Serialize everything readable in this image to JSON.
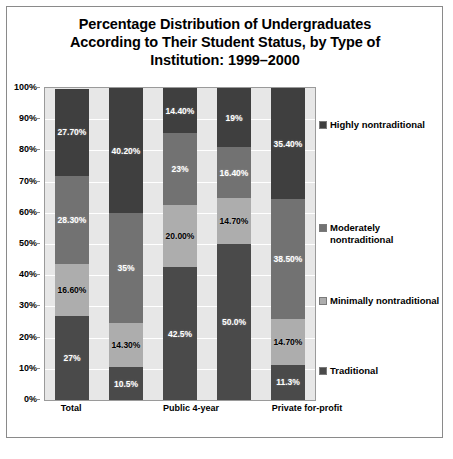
{
  "chart_data": {
    "type": "bar",
    "subtype": "stacked-100-percent",
    "title": "Percentage Distribution of Undergraduates According to Their Student Status, by Type of Institution: 1999–2000",
    "title_lines": [
      "Percentage Distribution of Undergraduates",
      "According to Their Student Status, by Type of",
      "Institution: 1999–2000"
    ],
    "xlabel": "",
    "ylabel": "",
    "ylim": [
      0,
      100
    ],
    "grid": true,
    "legend_position": "right",
    "categories": [
      "Total",
      "",
      "Public 4-year",
      "",
      "Private for-profit"
    ],
    "x_tick_labels_visible": [
      "Total",
      "Public 4-year",
      "Private for-profit"
    ],
    "y_tick_labels": [
      "100%",
      "90%",
      "80%",
      "70%",
      "60%",
      "50%",
      "40%",
      "30%",
      "20%",
      "10%",
      "0%"
    ],
    "y_tick_values": [
      100,
      90,
      80,
      70,
      60,
      50,
      40,
      30,
      20,
      10,
      0
    ],
    "series": [
      {
        "name": "Traditional",
        "color": "#4a4a4a",
        "values": [
          27.0,
          10.5,
          42.5,
          50.0,
          11.3
        ],
        "labels": [
          "27%",
          "10.5%",
          "42.5%",
          "50.0%",
          "11.3%"
        ]
      },
      {
        "name": "Minimally nontraditional",
        "color": "#adadad",
        "values": [
          16.6,
          14.3,
          20.0,
          14.7,
          14.7
        ],
        "labels": [
          "16.60%",
          "14.30%",
          "20.00%",
          "14.70%",
          "14.70%"
        ]
      },
      {
        "name": "Moderately nontraditional",
        "color": "#727272",
        "values": [
          28.3,
          35.0,
          23.0,
          16.4,
          38.5
        ],
        "labels": [
          "28.30%",
          "35%",
          "23%",
          "16.40%",
          "38.50%"
        ]
      },
      {
        "name": "Highly nontraditional",
        "color": "#3f3f3f",
        "values": [
          27.7,
          40.2,
          14.4,
          19.0,
          35.4
        ],
        "labels": [
          "27.70%",
          "40.20%",
          "14.40%",
          "19%",
          "35.40%"
        ]
      }
    ]
  },
  "legend": {
    "entries": [
      {
        "label": "Highly nontraditional",
        "color": "#3f3f3f"
      },
      {
        "label": "Moderately\nnontraditional",
        "color": "#727272"
      },
      {
        "label": "Minimally nontraditional",
        "color": "#adadad"
      },
      {
        "label": "Traditional",
        "color": "#4a4a4a"
      }
    ]
  },
  "colors": {
    "plot_background": "#e7e7e7",
    "gridline": "#ffffff",
    "frame_border": "#8a8a8a",
    "text": "#000000"
  },
  "bottom_caption": ""
}
